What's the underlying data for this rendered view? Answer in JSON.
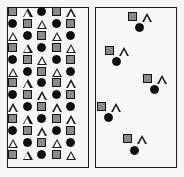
{
  "figure": {
    "name": "two-panel-shape-pattern-figure",
    "background_color": "#f5f5f3",
    "panel_border_color": "#1d1d1d",
    "panel_fill_color": "#f7f7f5"
  },
  "shape_legend": {
    "square": {
      "label": "gray square",
      "fill": "#8a8a8a",
      "stroke": "#141414"
    },
    "triangle": {
      "label": "white triangle",
      "fill": "#fbfbfa",
      "stroke": "#1a1a1a"
    },
    "circle": {
      "label": "black circle",
      "fill": "#0e0e0e",
      "stroke": "#0e0e0e"
    }
  },
  "chart_data": {
    "type": "scatter",
    "title": "",
    "xlabel": "",
    "ylabel": "",
    "grid": false,
    "legend_position": "none",
    "panels": [
      {
        "id": "dense",
        "label": "dense grid panel",
        "layout": "grid",
        "rows": 13,
        "columns": 5,
        "cell_pitch_x": 14.6,
        "cell_pitch_y": 11.9,
        "origin": {
          "x": 13,
          "y": 12
        },
        "pattern_cycle": 3,
        "grid": [
          [
            "square",
            "triangle",
            "circle",
            "square",
            "triangle"
          ],
          [
            "circle",
            "square",
            "triangle",
            "circle",
            "square"
          ],
          [
            "triangle",
            "circle",
            "square",
            "triangle",
            "circle"
          ],
          [
            "square",
            "triangle",
            "circle",
            "square",
            "triangle"
          ],
          [
            "circle",
            "square",
            "triangle",
            "circle",
            "square"
          ],
          [
            "triangle",
            "circle",
            "square",
            "triangle",
            "circle"
          ],
          [
            "square",
            "triangle",
            "circle",
            "square",
            "triangle"
          ],
          [
            "circle",
            "square",
            "triangle",
            "circle",
            "square"
          ],
          [
            "triangle",
            "circle",
            "square",
            "triangle",
            "circle"
          ],
          [
            "square",
            "triangle",
            "circle",
            "square",
            "triangle"
          ],
          [
            "circle",
            "square",
            "triangle",
            "circle",
            "square"
          ],
          [
            "triangle",
            "circle",
            "square",
            "triangle",
            "circle"
          ],
          [
            "square",
            "triangle",
            "circle",
            "square",
            "triangle"
          ]
        ]
      },
      {
        "id": "sparse",
        "label": "sparse cluster panel",
        "layout": "clusters",
        "cluster_count": 5,
        "clusters": [
          {
            "index": 1,
            "shapes": [
              {
                "type": "square",
                "x": 133,
                "y": 17
              },
              {
                "type": "triangle",
                "y": 17,
                "x": 147
              },
              {
                "type": "circle",
                "x": 140,
                "y": 28
              }
            ]
          },
          {
            "index": 2,
            "shapes": [
              {
                "type": "square",
                "x": 110,
                "y": 51
              },
              {
                "type": "triangle",
                "x": 124,
                "y": 51
              },
              {
                "type": "circle",
                "x": 117,
                "y": 62
              }
            ]
          },
          {
            "index": 3,
            "shapes": [
              {
                "type": "square",
                "x": 148,
                "y": 79
              },
              {
                "type": "triangle",
                "x": 162,
                "y": 79
              },
              {
                "type": "circle",
                "x": 155,
                "y": 90
              }
            ]
          },
          {
            "index": 4,
            "shapes": [
              {
                "type": "square",
                "x": 102,
                "y": 107
              },
              {
                "type": "triangle",
                "x": 116,
                "y": 107
              },
              {
                "type": "circle",
                "x": 109,
                "y": 118
              }
            ]
          },
          {
            "index": 5,
            "shapes": [
              {
                "type": "square",
                "x": 128,
                "y": 139
              },
              {
                "type": "triangle",
                "x": 142,
                "y": 139
              },
              {
                "type": "circle",
                "x": 135,
                "y": 151
              }
            ]
          }
        ]
      }
    ]
  }
}
